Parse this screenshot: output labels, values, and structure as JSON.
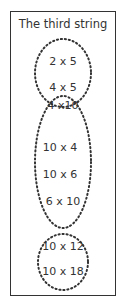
{
  "title": "The third string",
  "groups": [
    {
      "name": "group-1",
      "items": [
        "2 x 5",
        "4 x 5",
        "4 x10"
      ]
    },
    {
      "name": "group-2",
      "items": [
        "4 x10",
        "10 x 4",
        "10 x 6",
        "6 x 10"
      ]
    },
    {
      "name": "group-3",
      "items": [
        "10 x 12",
        "10 x 18"
      ]
    }
  ],
  "labels": [
    "2 x 5",
    "4 x 5",
    "4 x10",
    "10 x 4",
    "10 x 6",
    "6 x 10",
    "10 x 12",
    "10 x 18"
  ],
  "colors": {
    "stroke": "#333333",
    "text": "#333333",
    "background": "#ffffff"
  }
}
